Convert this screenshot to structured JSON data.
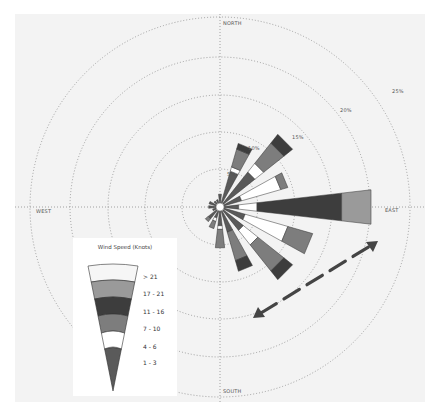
{
  "chart_data": {
    "type": "windrose",
    "title": "",
    "center_px": [
      205,
      193
    ],
    "directions": [
      "N",
      "NNE",
      "NE",
      "ENE",
      "E",
      "ESE",
      "SE",
      "SSE",
      "S",
      "SSW",
      "SW",
      "WSW",
      "W",
      "WNW",
      "NW",
      "NNW"
    ],
    "direction_labels": {
      "north": "NORTH",
      "east": "EAST",
      "south": "SOUTH",
      "west": "WEST"
    },
    "rings": [
      {
        "value": 5,
        "label": "5%",
        "r": 38
      },
      {
        "value": 10,
        "label": "10%",
        "r": 75
      },
      {
        "value": 15,
        "label": "15%",
        "r": 112
      },
      {
        "value": 20,
        "label": "20%",
        "r": 150
      },
      {
        "value": 25,
        "label": "25%",
        "r": 190
      }
    ],
    "speed_bins": [
      {
        "label": "1 - 3",
        "color": "#5a5a5a"
      },
      {
        "label": "4 - 6",
        "color": "#ffffff"
      },
      {
        "label": "7 - 10",
        "color": "#7d7d7d"
      },
      {
        "label": "11 - 16",
        "color": "#3d3d3d"
      },
      {
        "label": "17 - 21",
        "color": "#9a9a9a"
      },
      {
        "label": "> 21",
        "color": "#f6f6f6"
      }
    ],
    "series_pct": [
      {
        "dir": "N",
        "angle": 0,
        "bins": [
          1.2,
          0.0,
          0.0,
          0.0,
          0.0,
          0.0
        ]
      },
      {
        "dir": "NNE",
        "angle": 22.5,
        "bins": [
          4.5,
          0.6,
          2.5,
          0.8,
          0.0,
          0.0
        ]
      },
      {
        "dir": "NE",
        "angle": 45,
        "bins": [
          5.5,
          1.5,
          3.5,
          1.5,
          0.0,
          0.0
        ]
      },
      {
        "dir": "ENE",
        "angle": 67.5,
        "bins": [
          2.5,
          5.5,
          1.0,
          0.0,
          0.0,
          0.0
        ]
      },
      {
        "dir": "E",
        "angle": 90,
        "bins": [
          2.0,
          2.5,
          0.0,
          11.5,
          4.0,
          0.0
        ]
      },
      {
        "dir": "ESE",
        "angle": 112.5,
        "bins": [
          3.0,
          6.0,
          3.5,
          0.0,
          0.0,
          0.0
        ]
      },
      {
        "dir": "SE",
        "angle": 135,
        "bins": [
          3.5,
          2.5,
          4.5,
          1.5,
          0.0,
          0.0
        ]
      },
      {
        "dir": "SSE",
        "angle": 157.5,
        "bins": [
          3.0,
          0.0,
          4.0,
          1.5,
          0.0,
          0.0
        ]
      },
      {
        "dir": "S",
        "angle": 180,
        "bins": [
          2.0,
          0.5,
          2.5,
          0.0,
          0.0,
          0.0
        ]
      },
      {
        "dir": "SSW",
        "angle": 202.5,
        "bins": [
          1.0,
          0.5,
          1.0,
          0.0,
          0.0,
          0.0
        ]
      },
      {
        "dir": "SW",
        "angle": 225,
        "bins": [
          1.5,
          0.0,
          0.5,
          0.0,
          0.0,
          0.0
        ]
      },
      {
        "dir": "WSW",
        "angle": 247.5,
        "bins": [
          0.5,
          0.0,
          0.0,
          0.0,
          0.0,
          0.0
        ]
      },
      {
        "dir": "W",
        "angle": 270,
        "bins": [
          1.0,
          0.0,
          0.0,
          0.0,
          0.0,
          0.0
        ]
      },
      {
        "dir": "WNW",
        "angle": 292.5,
        "bins": [
          1.0,
          0.0,
          0.0,
          0.0,
          0.0,
          0.0
        ]
      },
      {
        "dir": "NW",
        "angle": 315,
        "bins": [
          0.5,
          0.0,
          0.0,
          0.0,
          0.0,
          0.0
        ]
      },
      {
        "dir": "NNW",
        "angle": 337.5,
        "bins": [
          0.5,
          0.0,
          0.0,
          0.0,
          0.0,
          0.0
        ]
      }
    ],
    "annotation": {
      "type": "double-headed dashed arrow",
      "description": "dashed arrow from lower-left to upper-right (SW-NE axis)"
    },
    "grid": true,
    "legend_position": "lower-left"
  },
  "legend": {
    "title": "Wind Speed (Knots)",
    "items": [
      "> 21",
      "17 - 21",
      "11 - 16",
      "7 - 10",
      "4 - 6",
      "1 - 3"
    ]
  },
  "labels": {
    "north": "NORTH",
    "east": "EAST",
    "south": "SOUTH",
    "west": "WEST",
    "ring_5": "5%",
    "ring_10": "10%",
    "ring_15": "15%",
    "ring_20": "20%",
    "ring_25": "25%"
  }
}
